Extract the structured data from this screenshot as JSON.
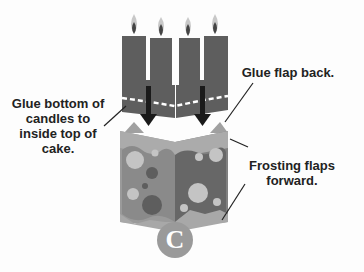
{
  "labels": {
    "candle_instruction": "Glue bottom of candles to inside top of cake.",
    "candle_instruction_lines": [
      "Glue bottom of",
      "candles to",
      "inside top of",
      "cake."
    ],
    "glue_flap": "Glue flap back.",
    "frosting_lines": [
      "Frosting flaps",
      "forward."
    ]
  },
  "step_badge": {
    "letter": "C"
  },
  "colors": {
    "background": "#fdfdfd",
    "candle": "#5e5e5e",
    "flame_outer": "#c8c8c8",
    "flame_inner": "#4a4a4a",
    "arrow": "#1a1a1a",
    "cake_left": "#8a8a8a",
    "cake_right": "#6a6a6a",
    "frosting": "#a9a9a9",
    "dots_light": "#c4c4c4",
    "dots_dark": "#555555",
    "badge": "#9a9a9a",
    "text": "#222222"
  }
}
